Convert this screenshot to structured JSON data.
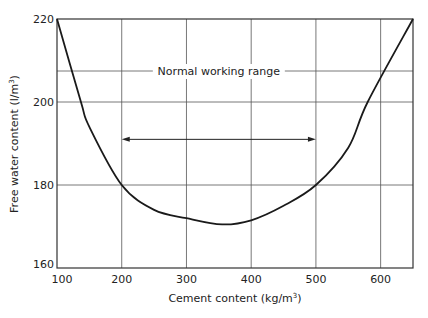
{
  "chart_data": {
    "type": "line",
    "title": "",
    "xlabel": "Cement content (kg/m³)",
    "ylabel": "Free water content (l/m³)",
    "xlim": [
      100,
      650
    ],
    "ylim": [
      160,
      220
    ],
    "x_ticks": [
      100,
      200,
      300,
      400,
      500,
      600
    ],
    "y_ticks": [
      160,
      180,
      200,
      220
    ],
    "grid": true,
    "legend": null,
    "series": [
      {
        "name": "Free water content",
        "x": [
          100,
          137,
          150,
          200,
          250,
          300,
          355,
          400,
          450,
          500,
          550,
          580,
          650
        ],
        "y": [
          220,
          200,
          194,
          180,
          174,
          172,
          170.5,
          171.5,
          175,
          180,
          189,
          200,
          220
        ]
      }
    ],
    "annotations": [
      {
        "text": "Normal working range",
        "type": "double-arrow",
        "x_start": 200,
        "x_end": 500,
        "y": 191
      }
    ]
  },
  "labels": {
    "x_axis_title": "Cement content (kg/m",
    "x_axis_sup": "3",
    "x_axis_close": ")",
    "y_axis_title": "Free water content (l/m",
    "y_axis_sup": "3",
    "y_axis_close": ")",
    "annotation": "Normal working range",
    "x_ticks": [
      "100",
      "200",
      "300",
      "400",
      "500",
      "600"
    ],
    "y_ticks": [
      "160",
      "180",
      "200",
      "220"
    ]
  },
  "colors": {
    "line": "#1a1a1a",
    "grid": "#555555",
    "background": "#ffffff"
  }
}
